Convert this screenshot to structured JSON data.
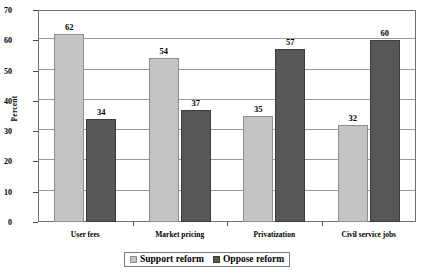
{
  "chart_data": {
    "type": "bar",
    "title": "",
    "xlabel": "",
    "ylabel": "Percent",
    "ylim": [
      0,
      70
    ],
    "yticks": [
      0,
      10,
      20,
      30,
      40,
      50,
      60,
      70
    ],
    "grid": true,
    "legend_position": "bottom",
    "categories": [
      "User fees",
      "Market pricing",
      "Privatization",
      "Civil service jobs"
    ],
    "series": [
      {
        "name": "Support reform",
        "color": "#c3c3c3",
        "values": [
          62,
          54,
          35,
          32
        ]
      },
      {
        "name": "Oppose reform",
        "color": "#575757",
        "values": [
          34,
          37,
          57,
          60
        ]
      }
    ]
  },
  "legend": {
    "items": [
      {
        "label": "Support reform",
        "swatch": "support"
      },
      {
        "label": "Oppose reform",
        "swatch": "oppose"
      }
    ]
  }
}
